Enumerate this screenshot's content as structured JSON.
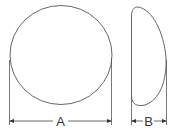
{
  "diagram": {
    "type": "dimension-drawing",
    "views": [
      {
        "name": "front-view",
        "shape": "circle",
        "dimension_label": "A",
        "dimension_meaning": "width/diameter"
      },
      {
        "name": "side-view",
        "shape": "dome-profile",
        "dimension_label": "B",
        "dimension_meaning": "projection/depth"
      }
    ],
    "labels": {
      "a": "A",
      "b": "B"
    },
    "colors": {
      "stroke": "#555555",
      "background": "#ffffff",
      "text": "#333333"
    }
  }
}
